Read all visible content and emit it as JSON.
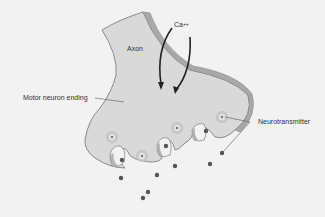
{
  "diagram": {
    "labels": {
      "axon": "Axon",
      "calcium": "Ca",
      "calcium_charge": "++",
      "motor_neuron_ending": "Motor neuron ending",
      "neurotransmitter": "Neurotransmitter"
    },
    "colors": {
      "background": "#f2f2f2",
      "cell_fill": "#d9d9d9",
      "membrane": "#a8a8a8",
      "membrane_dark": "#8a8a8a",
      "vesicle": "#c4c4c4",
      "molecule": "#555555",
      "arrow": "#222222"
    }
  }
}
